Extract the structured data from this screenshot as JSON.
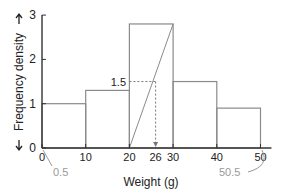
{
  "chart_data": {
    "type": "bar",
    "subtype": "histogram",
    "title": "",
    "xlabel": "Weight (g)",
    "ylabel": "Frequency density",
    "xlim": [
      0,
      50
    ],
    "ylim": [
      0,
      3
    ],
    "x_ticks": [
      0,
      10,
      20,
      26,
      30,
      40,
      50
    ],
    "y_ticks": [
      0,
      1,
      2,
      3
    ],
    "bins": [
      {
        "from": 0,
        "to": 10,
        "value": 1.0
      },
      {
        "from": 10,
        "to": 20,
        "value": 1.3
      },
      {
        "from": 20,
        "to": 30,
        "value": 2.8
      },
      {
        "from": 30,
        "to": 40,
        "value": 1.5
      },
      {
        "from": 40,
        "to": 50,
        "value": 0.9
      }
    ],
    "annotations": [
      {
        "text": "1.5",
        "type": "dashed-guide",
        "y": 1.5,
        "x": 26
      },
      {
        "text": "0.5",
        "type": "callout",
        "points_to_x": 0.5
      },
      {
        "text": "50.5",
        "type": "callout",
        "points_to_x": 50.5
      }
    ],
    "diagonal_line": {
      "from": [
        20,
        0
      ],
      "to": [
        30,
        2.8
      ]
    },
    "grid": false,
    "legend": null
  },
  "labels": {
    "xlabel": "Weight (g)",
    "ylabel": "Frequency density",
    "guide_value": "1.5",
    "left_callout": "0.5",
    "right_callout": "50.5"
  },
  "colors": {
    "axis": "#333333",
    "bar_stroke": "#8a8a8a",
    "callout_text": "#9a9a9a",
    "text": "#222222"
  }
}
